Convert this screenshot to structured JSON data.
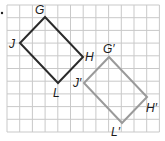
{
  "grid": {
    "x0": 7,
    "y0": 5,
    "cell": 12.7,
    "cols": 12,
    "rows": 10,
    "color": "#c9c9c9"
  },
  "original": {
    "name": "GHLJ",
    "color": "#2b2b2b",
    "vertices": [
      {
        "label": "G",
        "x": 45,
        "y": 17,
        "lx": 35,
        "ly": 14
      },
      {
        "label": "H",
        "x": 83,
        "y": 57,
        "lx": 85,
        "ly": 61
      },
      {
        "label": "L",
        "x": 58,
        "y": 83,
        "lx": 53,
        "ly": 97
      },
      {
        "label": "J",
        "x": 20,
        "y": 43,
        "lx": 9,
        "ly": 48
      }
    ]
  },
  "image": {
    "name": "G'H'L'J'",
    "color": "#9a9a9a",
    "vertices": [
      {
        "label": "G′",
        "x": 109,
        "y": 57,
        "lx": 103,
        "ly": 53
      },
      {
        "label": "H′",
        "x": 147,
        "y": 97,
        "lx": 146,
        "ly": 112
      },
      {
        "label": "L′",
        "x": 122,
        "y": 123,
        "lx": 111,
        "ly": 136
      },
      {
        "label": "J′",
        "x": 84,
        "y": 83,
        "lx": 73,
        "ly": 87
      }
    ]
  },
  "labels": {
    "G": "G",
    "H": "H",
    "L": "L",
    "J": "J",
    "G_prime": "G′",
    "H_prime": "H′",
    "L_prime": "L′",
    "J_prime": "J′"
  }
}
